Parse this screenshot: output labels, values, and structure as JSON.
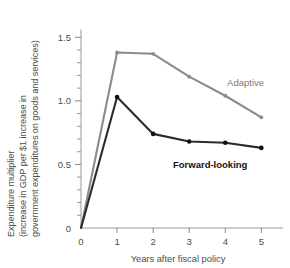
{
  "chart_data": {
    "type": "line",
    "title": "",
    "xlabel": "Years after fiscal policy",
    "ylabel_line1": "Expenditure multiplier",
    "ylabel_line2": "(increase in GDP per $1 increase in",
    "ylabel_line3": "government expenditures on goods and services)",
    "x": [
      0,
      1,
      2,
      3,
      4,
      5
    ],
    "xlim": [
      0,
      5.6
    ],
    "ylim": [
      0,
      1.62
    ],
    "xticks": [
      "0",
      "1",
      "2",
      "3",
      "4",
      "5"
    ],
    "yticks": [
      "0",
      "0.5",
      "1.0",
      "1.5"
    ],
    "ytick_values": [
      0,
      0.5,
      1.0,
      1.5
    ],
    "yminor_step": 0.1,
    "grid": false,
    "legend_position": "inline-annotation",
    "series": [
      {
        "name": "Adaptive",
        "color": "#8c8c8c",
        "marker_color": "#8c8c8c",
        "values": [
          0.0,
          1.38,
          1.37,
          1.19,
          1.04,
          0.87
        ],
        "label_x": 4.05,
        "label_y": 1.12
      },
      {
        "name": "Forward-looking",
        "color": "#2b2b2b",
        "marker_color": "#111111",
        "values": [
          0.0,
          1.03,
          0.74,
          0.68,
          0.67,
          0.63
        ],
        "label_x": 2.55,
        "label_y": 0.47
      }
    ]
  }
}
